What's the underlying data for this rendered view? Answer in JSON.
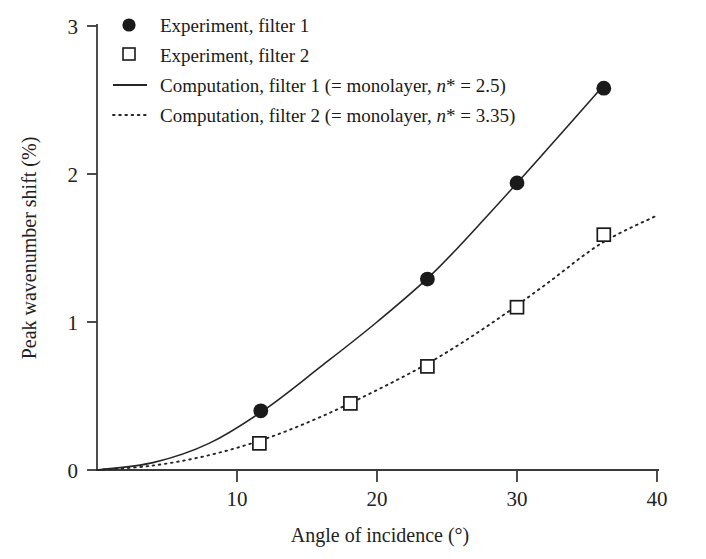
{
  "chart_data": {
    "type": "scatter",
    "title": "",
    "xlabel": "Angle of incidence (°)",
    "ylabel": "Peak wavenumber shift (%)",
    "xlim": [
      0,
      40
    ],
    "ylim": [
      0,
      3
    ],
    "xticks": [
      0,
      10,
      20,
      30,
      40
    ],
    "xtick_labels": [
      "0",
      "10",
      "20",
      "30",
      "40"
    ],
    "yticks": [
      0,
      1,
      2,
      3
    ],
    "ytick_labels": [
      "0",
      "1",
      "2",
      "3"
    ],
    "grid": false,
    "legend_position": "top-left",
    "series": [
      {
        "name": "Experiment, filter 1",
        "marker": "filled-circle",
        "style": "markers",
        "x": [
          11.7,
          23.6,
          30.0,
          36.2
        ],
        "y": [
          0.4,
          1.29,
          1.94,
          2.58
        ]
      },
      {
        "name": "Experiment, filter 2",
        "marker": "open-square",
        "style": "markers",
        "x": [
          11.6,
          18.1,
          23.6,
          30.0,
          36.2
        ],
        "y": [
          0.18,
          0.45,
          0.7,
          1.1,
          1.59
        ]
      },
      {
        "name": "Computation, filter 1 (= monolayer, n* = 2.5)",
        "marker": "none",
        "style": "solid-line",
        "x": [
          0,
          4,
          8,
          12,
          16,
          20,
          24,
          28,
          32,
          36.2
        ],
        "y": [
          0.0,
          0.05,
          0.18,
          0.41,
          0.7,
          1.0,
          1.33,
          1.73,
          2.15,
          2.6
        ]
      },
      {
        "name": "Computation, filter 2 (= monolayer, n* = 3.35)",
        "marker": "none",
        "style": "dotted-line",
        "x": [
          0,
          4,
          8,
          12,
          16,
          20,
          24,
          28,
          32,
          36,
          40
        ],
        "y": [
          0.0,
          0.03,
          0.1,
          0.21,
          0.36,
          0.54,
          0.74,
          0.98,
          1.25,
          1.53,
          1.72
        ]
      }
    ]
  },
  "legend": {
    "entries": [
      {
        "marker": "filled-circle",
        "text": "Experiment, filter 1",
        "pre": "Experiment, filter 1",
        "ital": "",
        "post": ""
      },
      {
        "marker": "open-square",
        "text": "Experiment, filter 2",
        "pre": "Experiment, filter 2",
        "ital": "",
        "post": ""
      },
      {
        "marker": "solid-line",
        "text": "Computation, filter 1 (= monolayer, n* = 2.5)",
        "pre": "Computation, filter 1 (= monolayer, ",
        "ital": "n",
        "post": "* = 2.5)"
      },
      {
        "marker": "dotted-line",
        "text": "Computation, filter 2 (= monolayer, n* = 3.35)",
        "pre": "Computation, filter 2 (= monolayer, ",
        "ital": "n",
        "post": "* = 3.35)"
      }
    ]
  },
  "axes": {
    "x_title": "Angle of incidence (°)",
    "y_title": "Peak wavenumber shift (%)",
    "x_labels": [
      "10",
      "20",
      "30",
      "40"
    ],
    "y_labels": [
      "0",
      "1",
      "2",
      "3"
    ]
  },
  "colors": {
    "ink": "#1a1a1a",
    "axis": "#3a3a3a",
    "background": "#ffffff"
  }
}
